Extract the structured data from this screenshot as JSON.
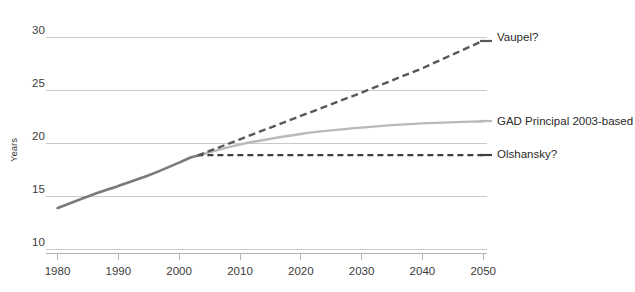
{
  "chart_data": {
    "type": "line",
    "title": "",
    "subtitle": "",
    "xlabel": "",
    "ylabel": "Years",
    "xlim": [
      1980,
      2050
    ],
    "ylim": [
      10,
      30
    ],
    "xticks": [
      1980,
      1990,
      2000,
      2010,
      2020,
      2030,
      2040,
      2050
    ],
    "yticks": [
      10,
      15,
      20,
      25,
      30
    ],
    "grid": "horizontal",
    "legend_position": "right-inline-labels",
    "series": [
      {
        "name": "Historical",
        "label": "",
        "style": "solid",
        "color": "#7a7a7a",
        "x": [
          1980,
          1985,
          1990,
          1995,
          2000,
          2002,
          2003
        ],
        "values": [
          13.9,
          15.0,
          16.0,
          17.0,
          18.2,
          18.7,
          18.85
        ]
      },
      {
        "name": "Vaupel?",
        "label": "Vaupel?",
        "style": "dashed",
        "color": "#585858",
        "x": [
          2003,
          2010,
          2020,
          2030,
          2040,
          2050
        ],
        "values": [
          18.85,
          20.4,
          22.6,
          24.8,
          27.1,
          29.7
        ]
      },
      {
        "name": "GAD Principal 2003-based",
        "label": "GAD Principal 2003-based",
        "style": "solid",
        "color": "#b9b9b9",
        "x": [
          2003,
          2010,
          2020,
          2030,
          2040,
          2050
        ],
        "values": [
          18.85,
          19.9,
          20.9,
          21.5,
          21.9,
          22.1
        ]
      },
      {
        "name": "Olshansky?",
        "label": "Olshansky?",
        "style": "dashed",
        "color": "#3f3f3f",
        "x": [
          2003,
          2010,
          2020,
          2030,
          2040,
          2050
        ],
        "values": [
          18.9,
          18.9,
          18.9,
          18.9,
          18.9,
          18.9
        ]
      }
    ]
  },
  "axis": {
    "y_title": "Years",
    "y_ticks": [
      "30",
      "25",
      "20",
      "15",
      "10"
    ],
    "x_ticks": [
      "1980",
      "1990",
      "2000",
      "2010",
      "2020",
      "2030",
      "2040",
      "2050"
    ]
  },
  "series_labels": {
    "vaupel": "Vaupel?",
    "gad": "GAD Principal 2003-based",
    "olshansky": "Olshansky?"
  },
  "colors": {
    "history": "#7a7a7a",
    "vaupel": "#585858",
    "gad": "#b9b9b9",
    "olshansky": "#3f3f3f",
    "grid": "#c9c9c9",
    "axis": "#b5b5b5",
    "text": "#2a2a2a",
    "background": "#ffffff"
  }
}
